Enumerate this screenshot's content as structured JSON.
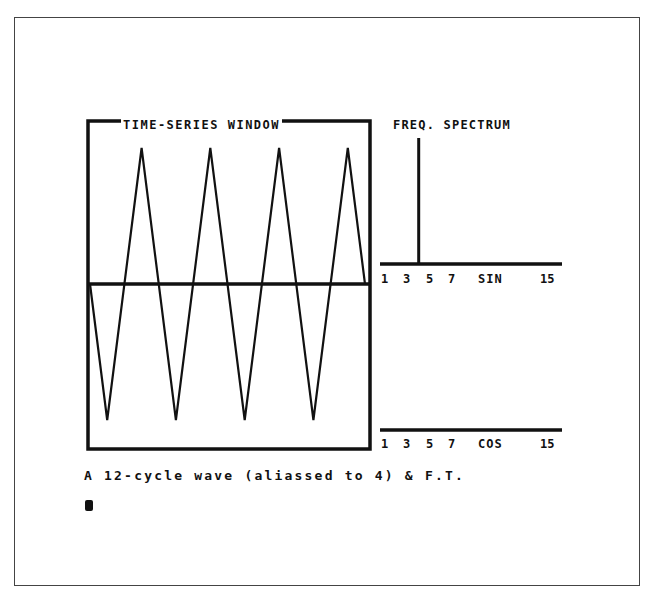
{
  "screen": {
    "time_series_title": "TIME-SERIES WINDOW",
    "spectrum_title": "FREQ. SPECTRUM",
    "sin_axis": {
      "ticks": [
        "1",
        "3",
        "5",
        "7",
        "SIN",
        "15"
      ]
    },
    "cos_axis": {
      "ticks": [
        "1",
        "3",
        "5",
        "7",
        "COS",
        "15"
      ]
    },
    "caption": "A 12-cycle wave (aliassed to 4) & F.T.",
    "cursor": "block-cursor"
  },
  "colors": {
    "ink": "#111111",
    "paper": "#ffffff",
    "frame": "#444444"
  },
  "chart_data": [
    {
      "type": "line",
      "title": "TIME-SERIES WINDOW",
      "description": "Triangle wave sampled from a 12-cycle wave, displayed aliased to 4 cycles",
      "xlabel": "",
      "ylabel": "",
      "grid": false,
      "x": [
        0,
        0.5,
        1.5,
        2.5,
        3.5,
        4.5,
        5.5,
        6.5,
        7.5,
        8.0
      ],
      "values": [
        0,
        -1,
        1,
        -1,
        1,
        -1,
        1,
        -1,
        1,
        0
      ],
      "cycles_displayed": 4,
      "ylim": [
        -1,
        1
      ]
    },
    {
      "type": "bar",
      "title": "FREQ. SPECTRUM",
      "series": [
        {
          "name": "SIN",
          "categories": [
            1,
            2,
            3,
            4,
            5,
            6,
            7,
            8,
            9,
            10,
            11,
            12,
            13,
            14,
            15
          ],
          "values": [
            0,
            0,
            0,
            1,
            0,
            0,
            0,
            0,
            0,
            0,
            0,
            0,
            0,
            0,
            0
          ]
        },
        {
          "name": "COS",
          "categories": [
            1,
            2,
            3,
            4,
            5,
            6,
            7,
            8,
            9,
            10,
            11,
            12,
            13,
            14,
            15
          ],
          "values": [
            0,
            0,
            0,
            0,
            0,
            0,
            0,
            0,
            0,
            0,
            0,
            0,
            0,
            0,
            0
          ]
        }
      ],
      "tick_labels_sin": [
        "1",
        "3",
        "5",
        "7",
        "SIN",
        "15"
      ],
      "tick_labels_cos": [
        "1",
        "3",
        "5",
        "7",
        "COS",
        "15"
      ],
      "xlim": [
        1,
        15
      ]
    }
  ]
}
